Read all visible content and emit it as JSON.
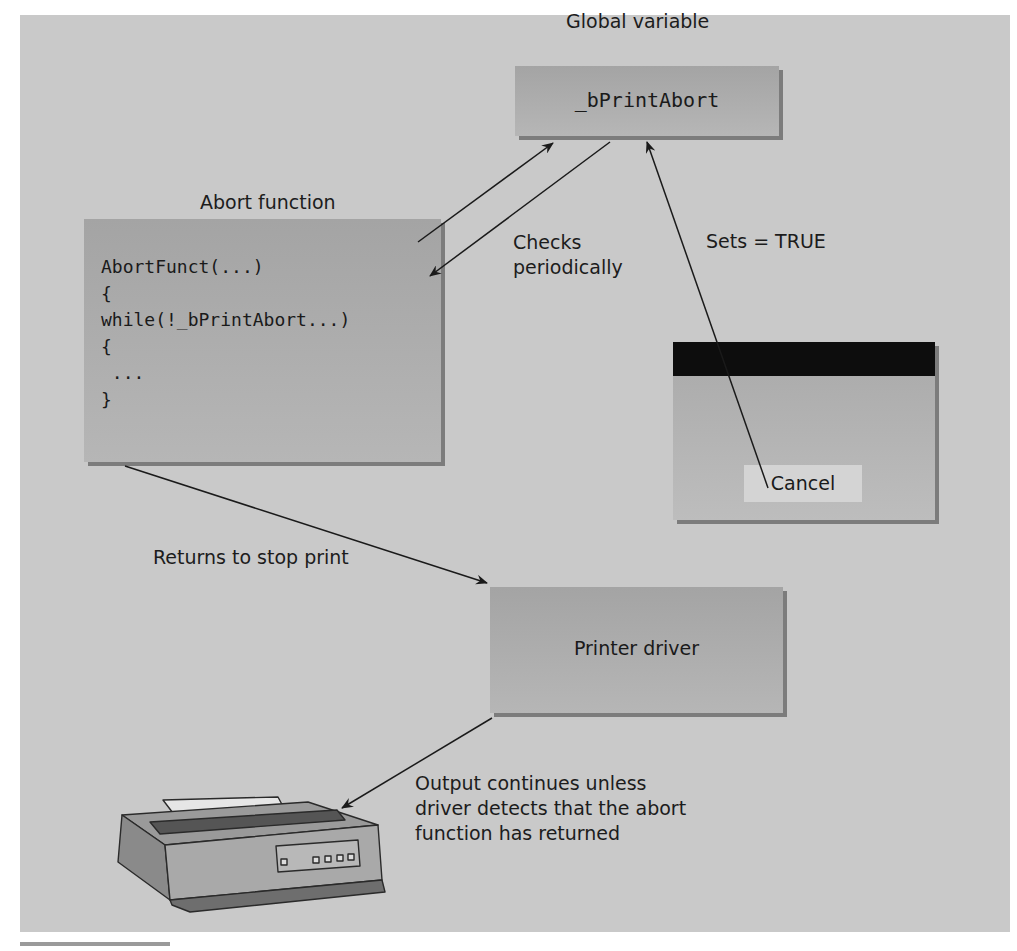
{
  "diagram": {
    "global_variable": {
      "caption": "Global variable",
      "name": "_bPrintAbort"
    },
    "abort_function": {
      "caption": "Abort function",
      "code_lines": [
        "AbortFunct(...)",
        "{",
        "while(!_bPrintAbort...)",
        "{",
        " ...",
        "}"
      ]
    },
    "dialog": {
      "cancel_label": "Cancel"
    },
    "printer_driver": {
      "label": "Printer driver"
    },
    "edge_labels": {
      "checks": [
        "Checks",
        "periodically"
      ],
      "sets": "Sets = TRUE",
      "returns": "Returns to stop print",
      "output": [
        "Output continues unless",
        "driver detects that the abort",
        "function has returned"
      ]
    },
    "icons": {
      "printer": "printer-icon"
    },
    "colors": {
      "background": "#c9c9c9",
      "box": "#acacac",
      "box_shadow": "#7c7c7c",
      "titlebar": "#0d0d0d",
      "button": "#d4d4d4"
    }
  }
}
